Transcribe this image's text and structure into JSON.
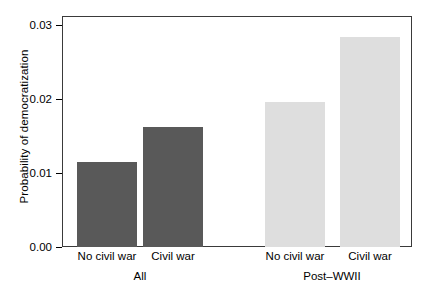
{
  "chart_data": {
    "type": "bar",
    "title": "",
    "xlabel": "",
    "ylabel": "Probability of democratization",
    "ylim": [
      0.0,
      0.03
    ],
    "grid": false,
    "legend": "none",
    "categories": [
      "No civil war",
      "Civil war",
      "No civil war",
      "Civil war"
    ],
    "groups": [
      {
        "label": "All",
        "categories": [
          "No civil war",
          "Civil war"
        ],
        "values": [
          0.011,
          0.0156
        ],
        "color": "#595959"
      },
      {
        "label": "Post–WWII",
        "categories": [
          "No civil war",
          "Civil war"
        ],
        "values": [
          0.0188,
          0.0273
        ],
        "color": "#dedede"
      }
    ],
    "values": [
      0.011,
      0.0156,
      0.0188,
      0.0273
    ],
    "bar_colors": [
      "#595959",
      "#595959",
      "#dedede",
      "#dedede"
    ],
    "y_ticks": [
      "0.00",
      "0.01",
      "0.02",
      "0.03"
    ],
    "y_tick_values": [
      0.0,
      0.01,
      0.02,
      0.03
    ]
  },
  "axis": {
    "y_title": "Probability of democratization",
    "y_tick_0": "0.00",
    "y_tick_1": "0.01",
    "y_tick_2": "0.02",
    "y_tick_3": "0.03",
    "x_tick_0": "No civil war",
    "x_tick_1": "Civil war",
    "x_tick_2": "No civil war",
    "x_tick_3": "Civil war",
    "group_0": "All",
    "group_1": "Post–WWII"
  },
  "style": {
    "frame_color": "#3a3a3a",
    "dark_bar": "#595959",
    "light_bar": "#dedede",
    "background": "#ffffff"
  }
}
